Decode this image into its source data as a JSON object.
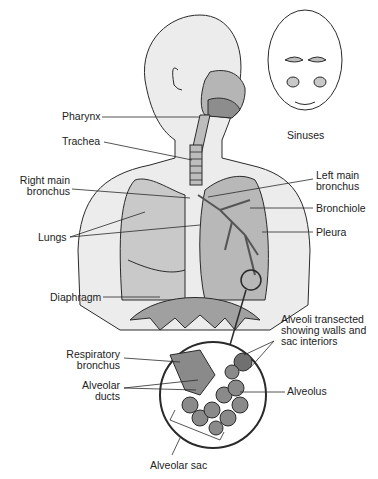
{
  "diagram": {
    "colors": {
      "line": "#2a2a2a",
      "body_fill": "#ececec",
      "lung_fill": "#c9c9c9",
      "lung_dark": "#9a9a9a",
      "airway_fill": "#8d8d8d",
      "alveoli_fill": "#8a8a8a",
      "background": "#ffffff"
    },
    "labels": {
      "pharynx": "Pharynx",
      "trachea": "Trachea",
      "sinuses": "Sinuses",
      "right_main_bronchus_1": "Right main",
      "right_main_bronchus_2": "bronchus",
      "left_main_bronchus_1": "Left main",
      "left_main_bronchus_2": "bronchus",
      "bronchiole": "Bronchiole",
      "lungs": "Lungs",
      "pleura": "Pleura",
      "diaphragm": "Diaphragm",
      "alveoli_transected_1": "Alveoli transected",
      "alveoli_transected_2": "showing walls and",
      "alveoli_transected_3": "sac interiors",
      "respiratory_bronchus_1": "Respiratory",
      "respiratory_bronchus_2": "bronchus",
      "alveolar_ducts_1": "Alveolar",
      "alveolar_ducts_2": "ducts",
      "alveolus": "Alveolus",
      "alveolar_sac": "Alveolar sac"
    }
  }
}
